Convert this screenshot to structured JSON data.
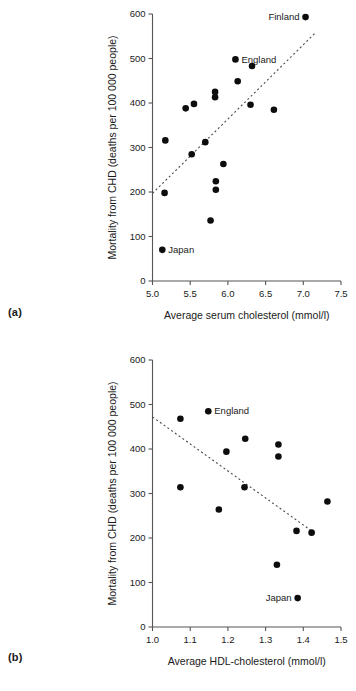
{
  "figure": {
    "panel_a_tag": "(a)",
    "panel_b_tag": "(b)"
  },
  "chart_data": [
    {
      "id": "a",
      "type": "scatter",
      "title": "",
      "xlabel": "Average serum cholesterol (mmol/l)",
      "ylabel": "Mortality from CHD (deaths per 100 000 people)",
      "xlim": [
        5.0,
        7.5
      ],
      "ylim": [
        0,
        600
      ],
      "xticks": [
        5.0,
        5.5,
        6.0,
        6.5,
        7.0,
        7.5
      ],
      "xticklabels": [
        "5.0",
        "5.5",
        "6.0",
        "6.5",
        "7.0",
        "7.5"
      ],
      "yticks": [
        0,
        100,
        200,
        300,
        400,
        500,
        600
      ],
      "yticklabels": [
        "0",
        "100",
        "200",
        "300",
        "400",
        "500",
        "600"
      ],
      "grid": false,
      "legend": "none",
      "points": [
        {
          "x": 7.03,
          "y": 593,
          "label": "Finland",
          "label_pos": "left"
        },
        {
          "x": 6.1,
          "y": 498,
          "label": "England",
          "label_pos": "right"
        },
        {
          "x": 6.32,
          "y": 483,
          "label": "",
          "label_pos": ""
        },
        {
          "x": 6.13,
          "y": 449,
          "label": "",
          "label_pos": ""
        },
        {
          "x": 5.83,
          "y": 425,
          "label": "",
          "label_pos": ""
        },
        {
          "x": 5.83,
          "y": 413,
          "label": "",
          "label_pos": ""
        },
        {
          "x": 5.55,
          "y": 398,
          "label": "",
          "label_pos": ""
        },
        {
          "x": 6.3,
          "y": 396,
          "label": "",
          "label_pos": ""
        },
        {
          "x": 5.44,
          "y": 388,
          "label": "",
          "label_pos": ""
        },
        {
          "x": 6.61,
          "y": 385,
          "label": "",
          "label_pos": ""
        },
        {
          "x": 5.17,
          "y": 316,
          "label": "",
          "label_pos": ""
        },
        {
          "x": 5.7,
          "y": 312,
          "label": "",
          "label_pos": ""
        },
        {
          "x": 5.52,
          "y": 285,
          "label": "",
          "label_pos": ""
        },
        {
          "x": 5.94,
          "y": 263,
          "label": "",
          "label_pos": ""
        },
        {
          "x": 5.84,
          "y": 224,
          "label": "",
          "label_pos": ""
        },
        {
          "x": 5.84,
          "y": 205,
          "label": "",
          "label_pos": ""
        },
        {
          "x": 5.16,
          "y": 198,
          "label": "",
          "label_pos": ""
        },
        {
          "x": 5.77,
          "y": 136,
          "label": "",
          "label_pos": ""
        },
        {
          "x": 5.13,
          "y": 70,
          "label": "Japan",
          "label_pos": "right"
        }
      ],
      "trendline": {
        "x0": 5.0,
        "y0": 197,
        "x1": 7.15,
        "y1": 556,
        "style": "dashed"
      }
    },
    {
      "id": "b",
      "type": "scatter",
      "title": "",
      "xlabel": "Average HDL-cholesterol (mmol/l)",
      "ylabel": "Mortality from CHD (deaths per 100 000 people)",
      "xlim": [
        1.0,
        1.5
      ],
      "ylim": [
        0,
        600
      ],
      "xticks": [
        1.0,
        1.1,
        1.2,
        1.3,
        1.4,
        1.5
      ],
      "xticklabels": [
        "1.0",
        "1.1",
        "1.2",
        "1.3",
        "1.4",
        "1.5"
      ],
      "yticks": [
        0,
        100,
        200,
        300,
        400,
        500,
        600
      ],
      "yticklabels": [
        "0",
        "100",
        "200",
        "300",
        "400",
        "500",
        "600"
      ],
      "grid": false,
      "legend": "none",
      "points": [
        {
          "x": 1.148,
          "y": 485,
          "label": "England",
          "label_pos": "right"
        },
        {
          "x": 1.074,
          "y": 468,
          "label": "",
          "label_pos": ""
        },
        {
          "x": 1.246,
          "y": 423,
          "label": "",
          "label_pos": ""
        },
        {
          "x": 1.334,
          "y": 410,
          "label": "",
          "label_pos": ""
        },
        {
          "x": 1.196,
          "y": 394,
          "label": "",
          "label_pos": ""
        },
        {
          "x": 1.334,
          "y": 383,
          "label": "",
          "label_pos": ""
        },
        {
          "x": 1.074,
          "y": 314,
          "label": "",
          "label_pos": ""
        },
        {
          "x": 1.244,
          "y": 314,
          "label": "",
          "label_pos": ""
        },
        {
          "x": 1.464,
          "y": 282,
          "label": "",
          "label_pos": ""
        },
        {
          "x": 1.176,
          "y": 264,
          "label": "",
          "label_pos": ""
        },
        {
          "x": 1.382,
          "y": 216,
          "label": "",
          "label_pos": ""
        },
        {
          "x": 1.422,
          "y": 212,
          "label": "",
          "label_pos": ""
        },
        {
          "x": 1.33,
          "y": 140,
          "label": "",
          "label_pos": ""
        },
        {
          "x": 1.385,
          "y": 65,
          "label": "Japan",
          "label_pos": "left"
        }
      ],
      "trendline": {
        "x0": 1.0,
        "y0": 472,
        "x1": 1.435,
        "y1": 208,
        "style": "dashed"
      }
    }
  ]
}
